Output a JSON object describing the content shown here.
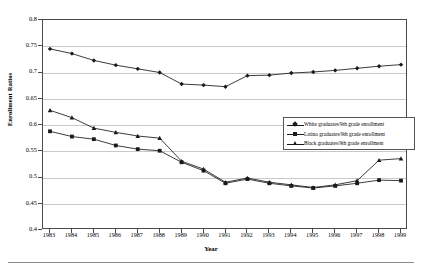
{
  "chart_data": {
    "type": "line",
    "title": "",
    "xlabel": "Year",
    "ylabel": "Enrollment Ratios",
    "xlim": [
      1983,
      1999
    ],
    "ylim": [
      0.4,
      0.8
    ],
    "yticks": [
      "0.4",
      "0.45",
      "0.5",
      "0.55",
      "0.6",
      "0.65",
      "0.7",
      "0.75",
      "0.8"
    ],
    "ytick_values": [
      0.4,
      0.45,
      0.5,
      0.55,
      0.6,
      0.65,
      0.7,
      0.75,
      0.8
    ],
    "grid": "horizontal",
    "legend_position": "inside-upper-right",
    "categories": [
      1983,
      1984,
      1985,
      1986,
      1987,
      1988,
      1989,
      1990,
      1991,
      1992,
      1993,
      1994,
      1995,
      1996,
      1997,
      1998,
      1999
    ],
    "xtick_labels": [
      "1983",
      "1984",
      "1985",
      "1986",
      "1987",
      "1988",
      "1989",
      "1990",
      "1991",
      "1992",
      "1993",
      "1994",
      "1995",
      "1996",
      "1997",
      "1998",
      "1999"
    ],
    "series": [
      {
        "name": "White graduates/9th grade enrollment",
        "marker": "diamond",
        "values": [
          0.745,
          0.736,
          0.723,
          0.714,
          0.707,
          0.7,
          0.678,
          0.676,
          0.673,
          0.694,
          0.695,
          0.699,
          0.701,
          0.704,
          0.708,
          0.712,
          0.715
        ]
      },
      {
        "name": "Latino graduates/9th grade enrollment",
        "marker": "square",
        "values": [
          0.588,
          0.578,
          0.573,
          0.561,
          0.554,
          0.551,
          0.529,
          0.513,
          0.489,
          0.497,
          0.489,
          0.484,
          0.48,
          0.484,
          0.489,
          0.495,
          0.494
        ]
      },
      {
        "name": "Black graduates/9th grade enrollment",
        "marker": "triangle",
        "values": [
          0.628,
          0.614,
          0.594,
          0.586,
          0.579,
          0.575,
          0.531,
          0.516,
          0.491,
          0.499,
          0.491,
          0.486,
          0.481,
          0.486,
          0.494,
          0.533,
          0.536
        ]
      }
    ]
  },
  "legend": {
    "items": [
      {
        "label": "White graduates/9th grade enrollment",
        "marker": "diamond"
      },
      {
        "label": "Latino graduates/9th grade enrollment",
        "marker": "square"
      },
      {
        "label": "Black graduates/9th grade enrollment",
        "marker": "triangle"
      }
    ]
  }
}
